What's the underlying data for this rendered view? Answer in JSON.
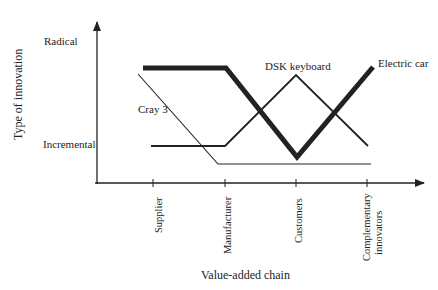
{
  "y_axis": {
    "title": "Type of innovation",
    "levels": [
      "Radical",
      "Incremental"
    ]
  },
  "x_axis": {
    "title": "Value-added chain",
    "ticks": [
      "Supplier",
      "Manufacturer",
      "Customers",
      "Complementary innovators"
    ],
    "tick_line1": "Complementary",
    "tick_line2": "innovators"
  },
  "series": [
    {
      "name": "Electric car",
      "style": "thick",
      "values": [
        "Radical",
        "Radical",
        "Incremental-low",
        "Radical"
      ]
    },
    {
      "name": "DSK keyboard",
      "style": "medium",
      "values": [
        "Incremental",
        "Incremental",
        "Radical",
        "Incremental"
      ]
    },
    {
      "name": "Cray 3",
      "style": "thin",
      "values": [
        "Radical",
        "Below incremental",
        "Below incremental",
        "Below incremental"
      ]
    }
  ]
}
